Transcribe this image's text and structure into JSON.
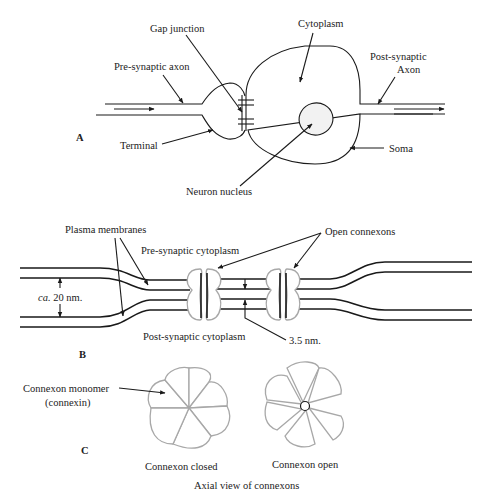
{
  "panels": {
    "a": {
      "label": "A",
      "labels": {
        "gap_junction": "Gap junction",
        "cytoplasm": "Cytoplasm",
        "pre_synaptic_axon": "Pre-synaptic axon",
        "post_synaptic_line1": "Post-synaptic",
        "post_synaptic_line2": "Axon",
        "terminal": "Terminal",
        "soma": "Soma",
        "neuron_nucleus": "Neuron nucleus"
      }
    },
    "b": {
      "label": "B",
      "labels": {
        "plasma_membranes": "Plasma membranes",
        "open_connexons": "Open connexons",
        "pre_synaptic_cytoplasm": "Pre-synaptic cytoplasm",
        "post_synaptic_cytoplasm": "Post-synaptic cytoplasm",
        "ca_prefix": "ca.",
        "ca_value": " 20 nm.",
        "gap_width": "3.5 nm."
      }
    },
    "c": {
      "label": "C",
      "labels": {
        "monomer_line1": "Connexon monomer",
        "monomer_line2": "(connexin)",
        "closed": "Connexon closed",
        "open": "Connexon open",
        "caption": "Axial view of connexons"
      }
    }
  },
  "colors": {
    "line": "#1a1a1a",
    "connexon_outline": "#a8a8a8",
    "nucleus_fill": "#f2f2f2"
  }
}
